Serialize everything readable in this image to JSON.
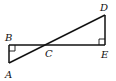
{
  "diagram": {
    "type": "geometry",
    "points": {
      "A": {
        "label": "A",
        "x": 9,
        "y": 63
      },
      "B": {
        "label": "B",
        "x": 9,
        "y": 45
      },
      "C": {
        "label": "C",
        "x": 50,
        "y": 45
      },
      "D": {
        "label": "D",
        "x": 105,
        "y": 15
      },
      "E": {
        "label": "E",
        "x": 105,
        "y": 45
      }
    },
    "segments": [
      "AB",
      "BE",
      "DE",
      "AD"
    ],
    "right_angles": [
      "B",
      "E"
    ],
    "labels": {
      "A": "A",
      "B": "B",
      "C": "C",
      "D": "D",
      "E": "E"
    }
  }
}
